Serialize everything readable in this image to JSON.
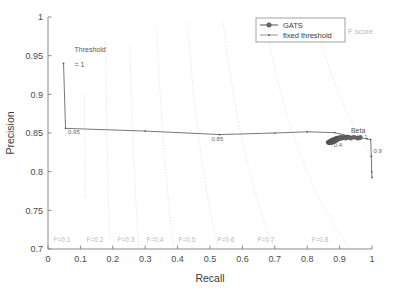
{
  "chart_data": {
    "type": "line",
    "title": "",
    "xlabel": "Recall",
    "ylabel": "Precision",
    "xlim": [
      0,
      1
    ],
    "ylim": [
      0.7,
      1
    ],
    "xticks": [
      "0",
      "0.1",
      "0.2",
      "0.3",
      "0.4",
      "0.5",
      "0.6",
      "0.7",
      "0.8",
      "0.9",
      "1"
    ],
    "xtick_values": [
      0,
      0.1,
      0.2,
      0.3,
      0.4,
      0.5,
      0.6,
      0.7,
      0.8,
      0.9,
      1
    ],
    "yticks": [
      "0.7",
      "0.75",
      "0.8",
      "0.85",
      "0.9",
      "0.95",
      "1"
    ],
    "ytick_values": [
      0.7,
      0.75,
      0.8,
      0.85,
      0.9,
      0.95,
      1
    ],
    "grid": false,
    "legend_position": "top-right",
    "legend_entries": [
      "GATS",
      "fixed threshold"
    ],
    "series": [
      {
        "name": "GATS",
        "marker": "circle-filled",
        "color": "#555555",
        "points": [
          [
            0.865,
            0.838
          ],
          [
            0.868,
            0.8375
          ],
          [
            0.87,
            0.8385
          ],
          [
            0.872,
            0.8395
          ],
          [
            0.874,
            0.8375
          ],
          [
            0.876,
            0.8405
          ],
          [
            0.878,
            0.839
          ],
          [
            0.88,
            0.841
          ],
          [
            0.881,
            0.8385
          ],
          [
            0.883,
            0.8415
          ],
          [
            0.885,
            0.84
          ],
          [
            0.887,
            0.8425
          ],
          [
            0.889,
            0.8405
          ],
          [
            0.891,
            0.843
          ],
          [
            0.893,
            0.8415
          ],
          [
            0.896,
            0.8435
          ],
          [
            0.899,
            0.8425
          ],
          [
            0.903,
            0.8445
          ],
          [
            0.908,
            0.8435
          ],
          [
            0.913,
            0.8445
          ],
          [
            0.919,
            0.8435
          ],
          [
            0.926,
            0.8445
          ],
          [
            0.934,
            0.8435
          ],
          [
            0.944,
            0.8445
          ],
          [
            0.955,
            0.8435
          ],
          [
            0.963,
            0.844
          ]
        ]
      },
      {
        "name": "fixed threshold",
        "marker": "dot-small",
        "color": "#555555",
        "points": [
          [
            0.048,
            0.94
          ],
          [
            0.054,
            0.856
          ],
          [
            0.3,
            0.8525
          ],
          [
            0.53,
            0.848
          ],
          [
            0.7,
            0.85
          ],
          [
            0.8,
            0.8515
          ],
          [
            0.885,
            0.8505
          ],
          [
            0.925,
            0.8465
          ],
          [
            0.955,
            0.8445
          ],
          [
            0.985,
            0.8425
          ],
          [
            0.996,
            0.8415
          ],
          [
            0.998,
            0.82
          ],
          [
            0.999,
            0.8
          ],
          [
            1.0,
            0.7925
          ]
        ]
      }
    ],
    "fscore_contours": {
      "label_prefix": "F=",
      "levels": [
        0.1,
        0.2,
        0.3,
        0.4,
        0.5,
        0.6,
        0.7,
        0.8,
        0.9
      ],
      "labels": [
        "F=0.1",
        "F=0.2",
        "F=0.3",
        "F=0.4",
        "F=0.5",
        "F=0.6",
        "F=0.7",
        "F=0.8"
      ],
      "color": "#d2d2d2",
      "caption": "F score"
    },
    "annotations": [
      {
        "name": "threshold-label",
        "text": "Threshold",
        "x": 0.082,
        "y": 0.955
      },
      {
        "name": "threshold-value",
        "text": "= 1",
        "x": 0.082,
        "y": 0.935
      },
      {
        "name": "threshold-095",
        "text": "0.95",
        "x": 0.062,
        "y": 0.849
      },
      {
        "name": "threshold-085",
        "text": "0.85",
        "x": 0.505,
        "y": 0.84
      },
      {
        "name": "beta-label",
        "text": "Beta",
        "x": 0.935,
        "y": 0.85
      },
      {
        "name": "beta-01",
        "text": "= 0.1",
        "x": 0.945,
        "y": 0.8425
      },
      {
        "name": "beta-04",
        "text": "0.4",
        "x": 0.882,
        "y": 0.8315
      },
      {
        "name": "beta-09",
        "text": "0.9",
        "x": 1.005,
        "y": 0.8245
      }
    ]
  }
}
